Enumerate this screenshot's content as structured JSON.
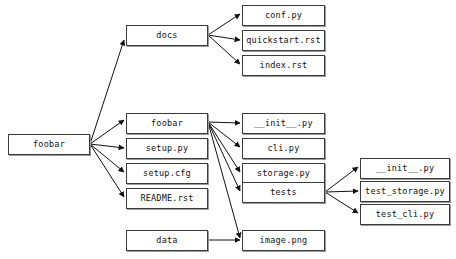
{
  "diagram": {
    "type": "directory-tree-graph",
    "canvas": {
      "width": 456,
      "height": 259,
      "background": "#ffffff"
    },
    "style": {
      "node_fill": "#ffffff",
      "node_border": "#3b3b3b",
      "node_shadow": "#9a9a9a",
      "edge_color": "#111111",
      "text_color": "#111111"
    },
    "nodes": [
      {
        "id": "root",
        "label": "foobar",
        "x": 8,
        "y": 134,
        "w": 82,
        "h": 21
      },
      {
        "id": "docs",
        "label": "docs",
        "x": 126,
        "y": 25,
        "w": 82,
        "h": 21
      },
      {
        "id": "conf",
        "label": "conf.py",
        "x": 242,
        "y": 5,
        "w": 83,
        "h": 21
      },
      {
        "id": "quickstart",
        "label": "quickstart.rst",
        "x": 242,
        "y": 30,
        "w": 83,
        "h": 21
      },
      {
        "id": "index",
        "label": "index.rst",
        "x": 242,
        "y": 55,
        "w": 83,
        "h": 21
      },
      {
        "id": "pkg",
        "label": "foobar",
        "x": 126,
        "y": 113,
        "w": 82,
        "h": 21
      },
      {
        "id": "setuppy",
        "label": "setup.py",
        "x": 126,
        "y": 138,
        "w": 82,
        "h": 21
      },
      {
        "id": "setupcfg",
        "label": "setup.cfg",
        "x": 126,
        "y": 163,
        "w": 82,
        "h": 21
      },
      {
        "id": "readme",
        "label": "README.rst",
        "x": 126,
        "y": 188,
        "w": 82,
        "h": 21
      },
      {
        "id": "pkginit",
        "label": "__init__.py",
        "x": 242,
        "y": 113,
        "w": 83,
        "h": 21
      },
      {
        "id": "cli",
        "label": "cli.py",
        "x": 242,
        "y": 138,
        "w": 83,
        "h": 21
      },
      {
        "id": "storage",
        "label": "storage.py",
        "x": 242,
        "y": 163,
        "w": 83,
        "h": 21
      },
      {
        "id": "tests",
        "label": "tests",
        "x": 242,
        "y": 182,
        "w": 83,
        "h": 21
      },
      {
        "id": "testsinit",
        "label": "__init__.py",
        "x": 360,
        "y": 158,
        "w": 90,
        "h": 21
      },
      {
        "id": "teststorage",
        "label": "test_storage.py",
        "x": 360,
        "y": 181,
        "w": 90,
        "h": 21
      },
      {
        "id": "testcli",
        "label": "test_cli.py",
        "x": 360,
        "y": 204,
        "w": 90,
        "h": 21
      },
      {
        "id": "data",
        "label": "data",
        "x": 126,
        "y": 230,
        "w": 82,
        "h": 21
      },
      {
        "id": "imagepng",
        "label": "image.png",
        "x": 242,
        "y": 230,
        "w": 83,
        "h": 21
      }
    ],
    "edges": [
      {
        "from": "root",
        "to": "docs",
        "x1": 90,
        "y1": 144,
        "x2": 124,
        "y2": 40
      },
      {
        "from": "root",
        "to": "pkg",
        "x1": 90,
        "y1": 144,
        "x2": 124,
        "y2": 120
      },
      {
        "from": "root",
        "to": "setuppy",
        "x1": 90,
        "y1": 144,
        "x2": 124,
        "y2": 148
      },
      {
        "from": "root",
        "to": "setupcfg",
        "x1": 90,
        "y1": 144,
        "x2": 124,
        "y2": 172
      },
      {
        "from": "root",
        "to": "readme",
        "x1": 90,
        "y1": 144,
        "x2": 124,
        "y2": 197
      },
      {
        "from": "docs",
        "to": "conf",
        "x1": 208,
        "y1": 35,
        "x2": 240,
        "y2": 14
      },
      {
        "from": "docs",
        "to": "quickstart",
        "x1": 208,
        "y1": 35,
        "x2": 240,
        "y2": 40
      },
      {
        "from": "docs",
        "to": "index",
        "x1": 208,
        "y1": 35,
        "x2": 240,
        "y2": 64
      },
      {
        "from": "pkg",
        "to": "pkginit",
        "x1": 208,
        "y1": 122,
        "x2": 240,
        "y2": 123
      },
      {
        "from": "pkg",
        "to": "cli",
        "x1": 208,
        "y1": 122,
        "x2": 240,
        "y2": 147
      },
      {
        "from": "pkg",
        "to": "storage",
        "x1": 208,
        "y1": 122,
        "x2": 240,
        "y2": 172
      },
      {
        "from": "pkg",
        "to": "tests",
        "x1": 208,
        "y1": 122,
        "x2": 240,
        "y2": 191
      },
      {
        "from": "pkg",
        "to": "imagepng",
        "x1": 208,
        "y1": 122,
        "x2": 240,
        "y2": 238
      },
      {
        "from": "tests",
        "to": "testsinit",
        "x1": 325,
        "y1": 192,
        "x2": 358,
        "y2": 167
      },
      {
        "from": "tests",
        "to": "teststorage",
        "x1": 325,
        "y1": 192,
        "x2": 358,
        "y2": 191
      },
      {
        "from": "tests",
        "to": "testcli",
        "x1": 325,
        "y1": 192,
        "x2": 358,
        "y2": 213
      },
      {
        "from": "data",
        "to": "imagepng",
        "x1": 208,
        "y1": 240,
        "x2": 240,
        "y2": 240
      }
    ]
  }
}
